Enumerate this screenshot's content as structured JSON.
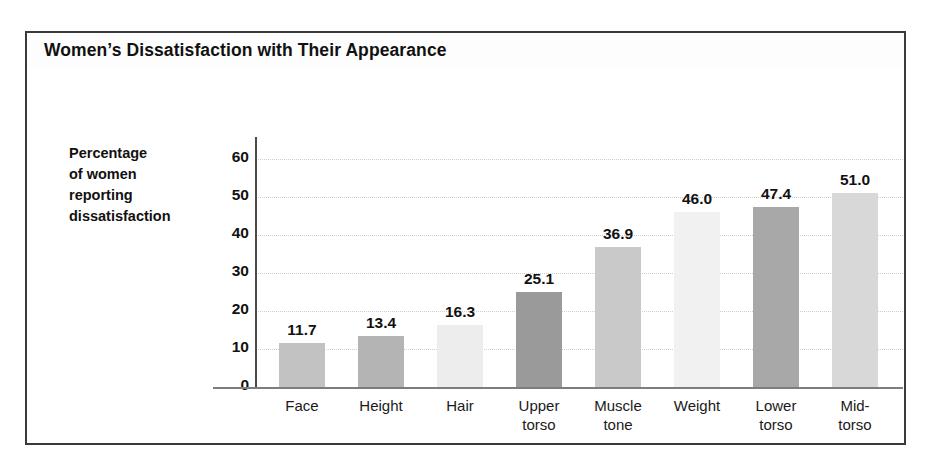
{
  "figure": {
    "title": "Women’s Dissatisfaction with Their Appearance",
    "border_color": "#3a3a3a",
    "background": "#ffffff"
  },
  "chart_data": {
    "type": "bar",
    "title": "Women’s Dissatisfaction with Their Appearance",
    "xlabel": "",
    "ylabel": "Percentage of women reporting dissatisfaction",
    "ylabel_lines": [
      "Percentage",
      "of women",
      "reporting",
      "dissatisfaction"
    ],
    "categories": [
      "Face",
      "Height",
      "Hair",
      "Upper torso",
      "Muscle tone",
      "Weight",
      "Lower torso",
      "Mid-torso"
    ],
    "category_lines": [
      [
        "Face"
      ],
      [
        "Height"
      ],
      [
        "Hair"
      ],
      [
        "Upper",
        "torso"
      ],
      [
        "Muscle",
        "tone"
      ],
      [
        "Weight"
      ],
      [
        "Lower",
        "torso"
      ],
      [
        "Mid-",
        "torso"
      ]
    ],
    "values": [
      11.7,
      13.4,
      16.3,
      25.1,
      36.9,
      46.0,
      47.4,
      51.0
    ],
    "value_labels": [
      "11.7",
      "13.4",
      "16.3",
      "25.1",
      "36.9",
      "46.0",
      "47.4",
      "51.0"
    ],
    "bar_colors": [
      "#c2c2c2",
      "#b4b4b4",
      "#ededed",
      "#9a9a9a",
      "#c9c9c9",
      "#f1f1f1",
      "#a8a8a8",
      "#d8d8d8"
    ],
    "ylim": [
      0,
      60
    ],
    "yticks": [
      0,
      10,
      20,
      30,
      40,
      50,
      60
    ],
    "ytick_labels": [
      "0",
      "10",
      "20",
      "30",
      "40",
      "50",
      "60"
    ],
    "grid": true,
    "grid_style": "dotted",
    "grid_color": "#cfcfcf",
    "legend": "none",
    "axis_color": "#4a4a4a"
  }
}
